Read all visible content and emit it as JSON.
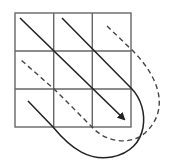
{
  "diagram": {
    "grid": {
      "rows": 3,
      "cols": 3,
      "x": 15,
      "y": 13,
      "size": 116,
      "stroke": "#555555"
    },
    "colors": {
      "line": "#2a2a2a",
      "dashed": "#444444",
      "background": "#ffffff"
    },
    "paths": [
      {
        "name": "solid-diagonal-main",
        "style": "solid",
        "arrow": true
      },
      {
        "name": "solid-diagonal-upper",
        "style": "solid"
      },
      {
        "name": "dashed-diagonal-upper",
        "style": "dashed"
      },
      {
        "name": "dashed-diagonal-lower",
        "style": "dashed"
      },
      {
        "name": "solid-diagonal-lower",
        "style": "solid"
      }
    ]
  }
}
